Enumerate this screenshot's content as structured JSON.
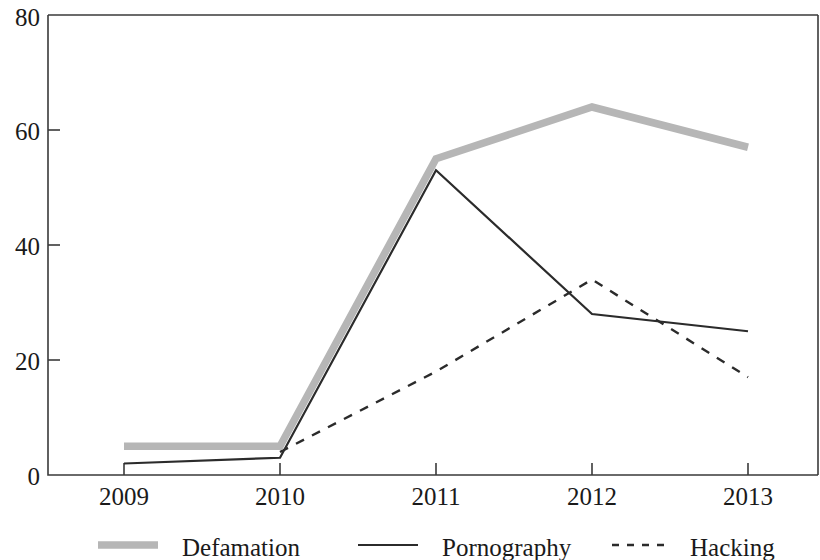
{
  "chart_data": {
    "type": "line",
    "title": "",
    "subtitle": "",
    "xlabel": "",
    "ylabel": "",
    "categories": [
      "2009",
      "2010",
      "2011",
      "2012",
      "2013"
    ],
    "x": [
      2009,
      2010,
      2011,
      2012,
      2013
    ],
    "xlim": [
      2009,
      2013
    ],
    "ylim": [
      0,
      80
    ],
    "y_ticks": [
      "0",
      "20",
      "40",
      "60",
      "80"
    ],
    "y_tick_values": [
      0,
      20,
      40,
      60,
      80
    ],
    "grid": false,
    "legend_position": "bottom",
    "series": [
      {
        "name": "Defamation",
        "style": "thick-solid",
        "color": "#b6b6b6",
        "values": [
          5,
          5,
          55,
          64,
          57
        ]
      },
      {
        "name": "Pornography",
        "style": "solid",
        "color": "#2b2b2b",
        "values": [
          2,
          3,
          53,
          28,
          25
        ]
      },
      {
        "name": "Hacking",
        "style": "dashed",
        "color": "#2b2b2b",
        "values": [
          null,
          4,
          18,
          34,
          17
        ]
      }
    ]
  },
  "axes": {
    "y_labels": [
      "80",
      "60",
      "40",
      "20",
      "0"
    ],
    "x_labels": [
      "2009",
      "2010",
      "2011",
      "2012",
      "2013"
    ]
  },
  "legend": {
    "items": [
      {
        "label": "Defamation",
        "swatch": "thick-gray-line-swatch"
      },
      {
        "label": "Pornography",
        "swatch": "solid-black-line-swatch"
      },
      {
        "label": "Hacking",
        "swatch": "dashed-black-line-swatch"
      }
    ]
  }
}
